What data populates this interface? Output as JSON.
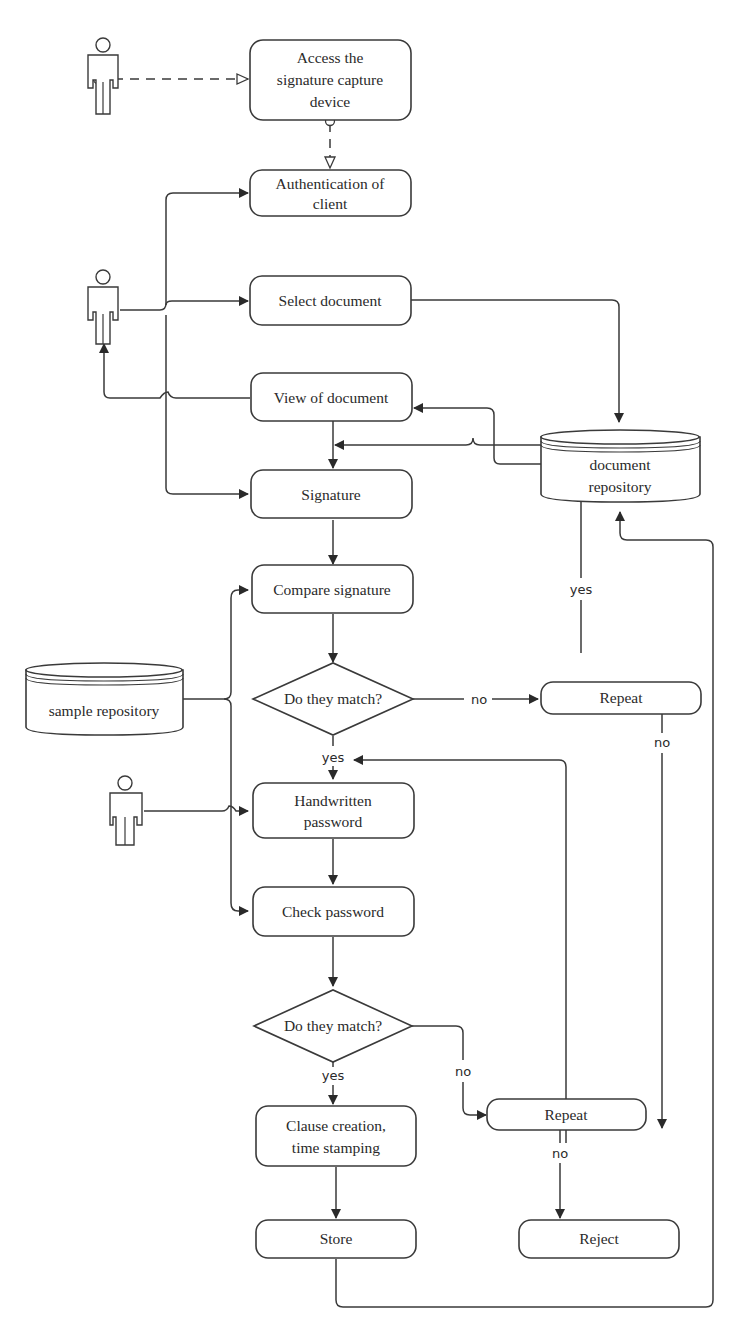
{
  "diagram": {
    "type": "flowchart",
    "nodes": {
      "access_device": {
        "lines": [
          "Access the",
          "signature capture",
          "device"
        ]
      },
      "auth_client": {
        "lines": [
          "Authentication of",
          "client"
        ]
      },
      "select_document": {
        "lines": [
          "Select document"
        ]
      },
      "view_document": {
        "lines": [
          "View of  document"
        ]
      },
      "signature": {
        "lines": [
          "Signature"
        ]
      },
      "compare_signature": {
        "lines": [
          "Compare signature"
        ]
      },
      "decision_sig": {
        "lines": [
          "Do they match?"
        ]
      },
      "repeat_sig": {
        "lines": [
          "Repeat"
        ]
      },
      "handwritten_password": {
        "lines": [
          "Handwritten",
          "password"
        ]
      },
      "check_password": {
        "lines": [
          "Check password"
        ]
      },
      "decision_pwd": {
        "lines": [
          "Do they match?"
        ]
      },
      "clause_creation": {
        "lines": [
          "Clause creation,",
          "time stamping"
        ]
      },
      "repeat_pwd": {
        "lines": [
          "Repeat"
        ]
      },
      "store": {
        "lines": [
          "Store"
        ]
      },
      "reject": {
        "lines": [
          "Reject"
        ]
      },
      "document_repository": {
        "lines": [
          "document",
          "repository"
        ]
      },
      "sample_repository": {
        "lines": [
          "sample repository"
        ]
      }
    },
    "edge_labels": {
      "sig_no": "no",
      "sig_yes": "yes",
      "repeat_sig_yes": "yes",
      "repeat_sig_no": "no",
      "pwd_yes": "yes",
      "pwd_no": "no",
      "repeat_pwd_no": "no"
    },
    "actors": [
      "actor-top",
      "actor-middle",
      "actor-bottom"
    ],
    "edges": [
      [
        "actor-top",
        "access_device",
        "dashed"
      ],
      [
        "access_device",
        "auth_client",
        "dashed"
      ],
      [
        "actor-middle",
        "auth_client"
      ],
      [
        "actor-middle",
        "select_document"
      ],
      [
        "actor-middle",
        "signature"
      ],
      [
        "view_document",
        "actor-middle"
      ],
      [
        "select_document",
        "document_repository"
      ],
      [
        "document_repository",
        "view_document"
      ],
      [
        "view_document",
        "signature"
      ],
      [
        "signature",
        "compare_signature"
      ],
      [
        "sample_repository",
        "compare_signature"
      ],
      [
        "sample_repository",
        "check_password"
      ],
      [
        "compare_signature",
        "decision_sig"
      ],
      [
        "decision_sig",
        "repeat_sig",
        "no"
      ],
      [
        "repeat_sig",
        "signature",
        "yes"
      ],
      [
        "repeat_sig",
        "reject",
        "no"
      ],
      [
        "decision_sig",
        "handwritten_password",
        "yes"
      ],
      [
        "actor-bottom",
        "handwritten_password"
      ],
      [
        "handwritten_password",
        "check_password"
      ],
      [
        "check_password",
        "decision_pwd"
      ],
      [
        "decision_pwd",
        "clause_creation",
        "yes"
      ],
      [
        "decision_pwd",
        "repeat_pwd",
        "no"
      ],
      [
        "repeat_pwd",
        "handwritten_password"
      ],
      [
        "repeat_pwd",
        "reject",
        "no"
      ],
      [
        "clause_creation",
        "store"
      ],
      [
        "store",
        "document_repository"
      ]
    ]
  }
}
